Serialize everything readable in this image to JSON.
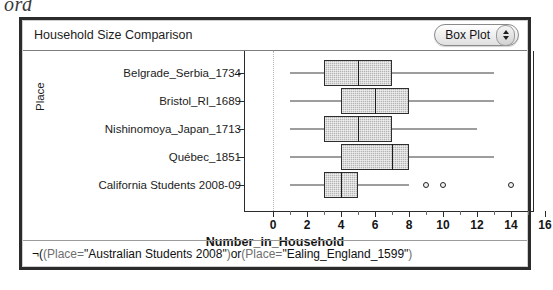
{
  "top_fragment": "ord",
  "header": {
    "title": "Household Size Comparison",
    "plot_type_label": "Box Plot",
    "stepper_up_icon": "triangle-up-icon",
    "stepper_down_icon": "triangle-down-icon"
  },
  "filter": {
    "not_symbol": "¬( ",
    "part1_field": "(Place",
    "part1_op": " = ",
    "part1_value": "\"Australian Students 2008\"",
    "part1_close": ")",
    "conjunction": " or ",
    "part2_field": "(Place",
    "part2_op": " = ",
    "part2_value": "\"Ealing_England_1599\"",
    "part2_close": ")",
    "full_text": "¬( (Place = \"Australian Students 2008\") or (Place = \"Ealing_England_1599\")"
  },
  "colors": {
    "box_fill": "#b5b5b5",
    "box_stroke": "#2e2e2e",
    "frame": "#2b2b2b",
    "text": "#1c1c1c"
  },
  "chart_data": {
    "type": "box",
    "title": "Household Size Comparison",
    "xlabel": "Number_in_Household",
    "ylabel": "Place",
    "xlim": [
      -0.6,
      16.9
    ],
    "xticks": [
      0,
      2,
      4,
      6,
      8,
      10,
      12,
      14,
      16
    ],
    "xticks_minor": [
      1,
      3,
      5,
      7,
      9,
      11,
      13,
      15
    ],
    "grid": false,
    "legend": "none",
    "orientation": "horizontal",
    "categories": [
      "Belgrade_Serbia_1734",
      "Bristol_RI_1689",
      "Nishinomoya_Japan_1713",
      "Québec_1851",
      "California Students 2008-09"
    ],
    "boxes": [
      {
        "category": "Belgrade_Serbia_1734",
        "whisker_low": 1,
        "q1": 3,
        "median": 5,
        "q3": 7,
        "whisker_high": 13,
        "outliers": []
      },
      {
        "category": "Bristol_RI_1689",
        "whisker_low": 1,
        "q1": 4,
        "median": 6,
        "q3": 8,
        "whisker_high": 13,
        "outliers": []
      },
      {
        "category": "Nishinomoya_Japan_1713",
        "whisker_low": 1,
        "q1": 3,
        "median": 5,
        "q3": 7,
        "whisker_high": 12,
        "outliers": []
      },
      {
        "category": "Québec_1851",
        "whisker_low": 1,
        "q1": 4,
        "median": 7,
        "q3": 8,
        "whisker_high": 13,
        "outliers": []
      },
      {
        "category": "California Students 2008-09",
        "whisker_low": 1,
        "q1": 3,
        "median": 4,
        "q3": 5,
        "whisker_high": 8,
        "outliers": [
          9,
          10,
          14
        ]
      }
    ]
  }
}
